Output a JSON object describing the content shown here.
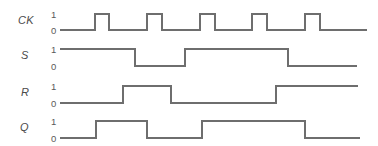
{
  "figure": {
    "type": "timing-diagram",
    "title": "",
    "background_color": "#ffffff",
    "wave_color": "#6e6e6e",
    "label_color": "#4a4a4a",
    "level_label_color": "#5a5a5a"
  },
  "axis": {
    "t_start": 60,
    "t_end": 367,
    "level_labels": [
      "1",
      "0"
    ]
  },
  "signals": [
    {
      "name": "CK",
      "label": "CK",
      "high_label": "1",
      "low_label": "0",
      "y_high": 14,
      "y_low": 30,
      "label_x": 18,
      "label_y": 24,
      "trace_end": 367,
      "initial": 0,
      "transitions": [
        95,
        109,
        147,
        162,
        200,
        215,
        252,
        267,
        305,
        320
      ]
    },
    {
      "name": "S",
      "label": "S",
      "high_label": "1",
      "low_label": "0",
      "y_high": 49,
      "y_low": 66,
      "label_x": 21,
      "label_y": 59,
      "trace_end": 357,
      "initial": 1,
      "transitions": [
        135,
        185,
        288
      ]
    },
    {
      "name": "R",
      "label": "R",
      "high_label": "1",
      "low_label": "0",
      "y_high": 86,
      "y_low": 103,
      "label_x": 21,
      "label_y": 96,
      "trace_end": 358,
      "initial": 0,
      "transitions": [
        123,
        171,
        276
      ]
    },
    {
      "name": "Q",
      "label": "Q",
      "high_label": "1",
      "low_label": "0",
      "y_high": 121,
      "y_low": 138,
      "label_x": 20,
      "label_y": 131,
      "trace_end": 360,
      "initial": 0,
      "transitions": [
        96,
        147,
        202,
        305
      ]
    }
  ],
  "chart_data": {
    "type": "line",
    "title": "",
    "xlabel": "",
    "ylabel": "",
    "categories": [
      "CK",
      "S",
      "R",
      "Q"
    ],
    "series": [
      {
        "name": "CK",
        "initial_level": 0,
        "edge_times": [
          95,
          109,
          147,
          162,
          200,
          215,
          252,
          267,
          305,
          320
        ]
      },
      {
        "name": "S",
        "initial_level": 1,
        "edge_times": [
          135,
          185,
          288
        ]
      },
      {
        "name": "R",
        "initial_level": 0,
        "edge_times": [
          123,
          171,
          276
        ]
      },
      {
        "name": "Q",
        "initial_level": 0,
        "edge_times": [
          96,
          147,
          202,
          305
        ]
      }
    ],
    "ytick_labels": [
      "0",
      "1"
    ],
    "grid": false,
    "legend": "none"
  }
}
